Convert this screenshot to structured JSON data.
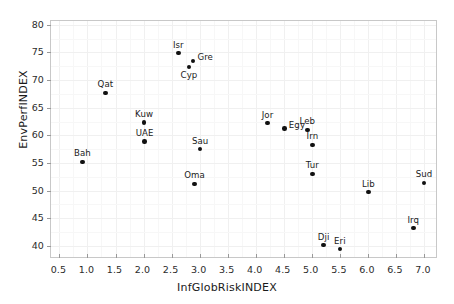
{
  "chart_data": {
    "type": "scatter",
    "title": "",
    "xlabel": "InfGlobRiskINDEX",
    "ylabel": "EnvPerfINDEX",
    "xlim": [
      0.35,
      7.25
    ],
    "ylim": [
      37.6,
      80.7
    ],
    "xticks": [
      "0.5",
      "1.0",
      "1.5",
      "2.0",
      "2.5",
      "3.0",
      "3.5",
      "4.0",
      "4.5",
      "5.0",
      "5.5",
      "6.0",
      "6.5",
      "7.0"
    ],
    "xtick_values": [
      0.5,
      1.0,
      1.5,
      2.0,
      2.5,
      3.0,
      3.5,
      4.0,
      4.5,
      5.0,
      5.5,
      6.0,
      6.5,
      7.0
    ],
    "yticks": [
      "40",
      "45",
      "50",
      "55",
      "60",
      "65",
      "70",
      "75",
      "80"
    ],
    "ytick_values": [
      40,
      45,
      50,
      55,
      60,
      65,
      70,
      75,
      80
    ],
    "grid": true,
    "legend": "none",
    "marker": "filled-circle",
    "marker_color": "#111111",
    "points": [
      {
        "label": "Bah",
        "x": 0.91,
        "y": 55.2,
        "label_pos": "above"
      },
      {
        "label": "Qat",
        "x": 1.32,
        "y": 67.7,
        "label_pos": "above"
      },
      {
        "label": "Kuw",
        "x": 2.01,
        "y": 62.3,
        "label_pos": "above"
      },
      {
        "label": "UAE",
        "x": 2.02,
        "y": 58.9,
        "label_pos": "above"
      },
      {
        "label": "Isr",
        "x": 2.62,
        "y": 74.9,
        "label_pos": "above"
      },
      {
        "label": "Cyp",
        "x": 2.81,
        "y": 72.4,
        "label_pos": "below"
      },
      {
        "label": "Gre",
        "x": 2.88,
        "y": 73.5,
        "label_pos": "right"
      },
      {
        "label": "Oma",
        "x": 2.91,
        "y": 51.2,
        "label_pos": "above"
      },
      {
        "label": "Sau",
        "x": 3.01,
        "y": 57.5,
        "label_pos": "above"
      },
      {
        "label": "Jor",
        "x": 4.21,
        "y": 62.2,
        "label_pos": "above"
      },
      {
        "label": "Egy",
        "x": 4.51,
        "y": 61.2,
        "label_pos": "right"
      },
      {
        "label": "Leb",
        "x": 4.92,
        "y": 61.0,
        "label_pos": "above"
      },
      {
        "label": "Irn",
        "x": 5.01,
        "y": 58.3,
        "label_pos": "above"
      },
      {
        "label": "Tur",
        "x": 5.01,
        "y": 53.0,
        "label_pos": "above"
      },
      {
        "label": "Dji",
        "x": 5.21,
        "y": 40.1,
        "label_pos": "above"
      },
      {
        "label": "Eri",
        "x": 5.5,
        "y": 39.4,
        "label_pos": "above"
      },
      {
        "label": "Lib",
        "x": 6.01,
        "y": 49.7,
        "label_pos": "above"
      },
      {
        "label": "Irq",
        "x": 6.81,
        "y": 43.2,
        "label_pos": "above"
      },
      {
        "label": "Sud",
        "x": 7.0,
        "y": 51.4,
        "label_pos": "above"
      }
    ]
  },
  "style": {
    "frame_color": "#c8c8c8",
    "grid_color": "#f0f0f0",
    "background": "#ffffff",
    "text_color": "#1a1a1a"
  }
}
